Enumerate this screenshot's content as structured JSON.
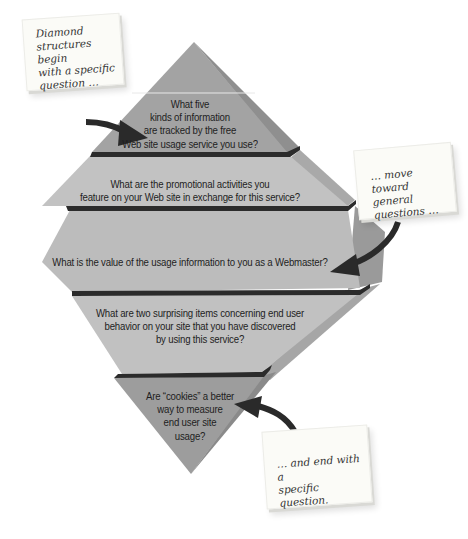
{
  "diagram": {
    "colors": {
      "face_dark": "#9c9c9c",
      "face_light": "#bdbdbd",
      "side_shadow": "#8a8a8a",
      "side_light": "#b0b0b0",
      "divider": "#2b2b2b",
      "arrow": "#2a2a2a",
      "note_bg": "#fbfbf7"
    },
    "tiers": [
      {
        "id": "tier-1",
        "lines": [
          "What five",
          "kinds of information",
          "are tracked by the free",
          "Web site usage service you use?"
        ]
      },
      {
        "id": "tier-2",
        "lines": [
          "What are the promotional activities you",
          "feature on your Web site in exchange for this service?"
        ]
      },
      {
        "id": "tier-3",
        "lines": [
          "What is the value of the usage information to you as a Webmaster?"
        ]
      },
      {
        "id": "tier-4",
        "lines": [
          "What are two surprising items concerning end user",
          "behavior on your site that you have discovered",
          "by using this service?"
        ]
      },
      {
        "id": "tier-5",
        "lines": [
          "Are “cookies” a better",
          "way to measure",
          "end user site",
          "usage?"
        ]
      }
    ],
    "notes": [
      {
        "id": "note-begin",
        "lines": [
          "Diamond",
          "structures begin",
          "with a specific",
          "question …"
        ]
      },
      {
        "id": "note-middle",
        "lines": [
          "… move toward",
          "general",
          "questions …"
        ]
      },
      {
        "id": "note-end",
        "lines": [
          "… and end with a",
          "specific question."
        ]
      }
    ]
  }
}
